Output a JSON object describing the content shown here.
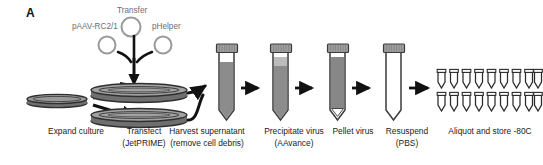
{
  "figure": {
    "panel_letter": "A",
    "type": "workflow-diagram"
  },
  "plasmids": {
    "transfer_label": "Transfer",
    "left_label": "pAAV-RC2/1",
    "right_label": "pHelper",
    "count": 3,
    "outline_color": "#9a9a9a"
  },
  "steps": [
    {
      "id": "expand-culture",
      "line1": "Expand culture",
      "line2": ""
    },
    {
      "id": "transfect",
      "line1": "Transfect",
      "line2": "(JetPRIME)"
    },
    {
      "id": "harvest-supernatant",
      "line1": "Harvest supernatant",
      "line2": "(remove cell debris)"
    },
    {
      "id": "precipitate-virus",
      "line1": "Precipitate virus",
      "line2": "(AAvance)"
    },
    {
      "id": "pellet-virus",
      "line1": "Pellet virus",
      "line2": ""
    },
    {
      "id": "resuspend",
      "line1": "Resuspend",
      "line2": "(PBS)"
    },
    {
      "id": "aliquot-store",
      "line1": "Aliquot and store -80C",
      "line2": ""
    }
  ],
  "dishes": {
    "small_count": 1,
    "large_count": 2
  },
  "tubes": [
    {
      "id": "tube-harvest",
      "fill": "medium-gray",
      "headspace": "white",
      "cap": true
    },
    {
      "id": "tube-precipitate",
      "fill": "medium-gray",
      "headspace": "light-gray",
      "cap": true
    },
    {
      "id": "tube-pellet",
      "fill": "dark-gray",
      "headspace": "white",
      "cap": true
    },
    {
      "id": "tube-resuspend",
      "fill": "empty",
      "headspace": "white",
      "cap": true
    }
  ],
  "aliquots": {
    "rows": 2,
    "per_row": 9,
    "total": 18
  },
  "colors": {
    "liquid_medium": "#8c8c8c",
    "liquid_dark": "#7a7a7a",
    "liquid_light": "#b8b8b8",
    "cap": "#9e9e9e",
    "outline": "#3a3a3a",
    "arrow": "#111111",
    "label_gray": "#6e6e6e",
    "text": "#1b1b1b",
    "background": "#ffffff"
  }
}
